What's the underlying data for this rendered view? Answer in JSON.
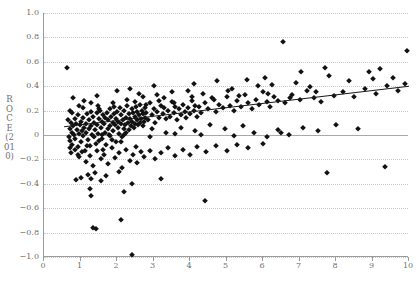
{
  "chart_data": {
    "type": "scatter",
    "title": "",
    "xlabel": "PBR (2010)",
    "ylabel": "ROCE (2010)",
    "xlim": [
      0,
      10
    ],
    "ylim": [
      -1.0,
      1.0
    ],
    "xticks": [
      0,
      1,
      2,
      3,
      4,
      5,
      6,
      7,
      8,
      9,
      10
    ],
    "xticklabels": [
      "0",
      "1",
      "2",
      "3",
      "4",
      "5",
      "6",
      "7",
      "8",
      "9",
      "10"
    ],
    "yticks": [
      -1.0,
      -0.8,
      -0.6,
      -0.4,
      -0.2,
      0,
      0.2,
      0.4,
      0.6,
      0.8,
      1.0
    ],
    "yticklabels": [
      "-1.0",
      "-0.8",
      "-0.6",
      "-0.4",
      "-0.2",
      "0",
      "0.2",
      "0.4",
      "0.6",
      "0.8",
      "1.0"
    ],
    "grid": "horizontal-dotted",
    "legend": "none",
    "marker": "filled-diamond",
    "marker_color": "#111111",
    "grid_color": "#c9c9c9",
    "axis_color": "#9a9a9a",
    "trendline": {
      "type": "linear-fit",
      "color": "#1a1a1a",
      "x_start": 0.55,
      "y_start": 0.068,
      "x_end": 10.0,
      "y_end": 0.4
    },
    "zero_line": {
      "y": 0,
      "color": "#a8a8a8"
    },
    "points": [
      [
        0.62,
        0.55
      ],
      [
        0.68,
        -0.02
      ],
      [
        0.7,
        0.05
      ],
      [
        0.72,
        -0.05
      ],
      [
        0.74,
        0.1
      ],
      [
        0.76,
        0.02
      ],
      [
        0.78,
        -0.08
      ],
      [
        0.8,
        0.07
      ],
      [
        0.82,
        0.0
      ],
      [
        0.84,
        0.13
      ],
      [
        0.86,
        -0.03
      ],
      [
        0.88,
        0.09
      ],
      [
        0.9,
        0.04
      ],
      [
        0.92,
        -0.1
      ],
      [
        0.94,
        0.16
      ],
      [
        0.96,
        0.01
      ],
      [
        0.98,
        0.08
      ],
      [
        1.0,
        -0.06
      ],
      [
        1.02,
        0.11
      ],
      [
        1.04,
        0.03
      ],
      [
        1.06,
        -0.01
      ],
      [
        1.08,
        0.14
      ],
      [
        1.1,
        0.06
      ],
      [
        1.12,
        -0.13
      ],
      [
        1.14,
        0.09
      ],
      [
        1.16,
        0.02
      ],
      [
        1.18,
        0.17
      ],
      [
        1.2,
        -0.04
      ],
      [
        1.22,
        0.12
      ],
      [
        1.24,
        0.05
      ],
      [
        1.26,
        -0.09
      ],
      [
        1.28,
        0.19
      ],
      [
        1.3,
        0.07
      ],
      [
        1.32,
        0.0
      ],
      [
        1.34,
        0.15
      ],
      [
        1.36,
        -0.02
      ],
      [
        1.38,
        0.1
      ],
      [
        1.4,
        0.04
      ],
      [
        1.42,
        -0.07
      ],
      [
        1.44,
        0.18
      ],
      [
        1.46,
        0.08
      ],
      [
        1.48,
        0.01
      ],
      [
        1.5,
        0.13
      ],
      [
        1.52,
        -0.05
      ],
      [
        1.54,
        0.2
      ],
      [
        1.56,
        0.06
      ],
      [
        1.58,
        0.11
      ],
      [
        1.6,
        -0.03
      ],
      [
        1.62,
        0.16
      ],
      [
        1.64,
        0.09
      ],
      [
        1.66,
        0.02
      ],
      [
        1.68,
        0.14
      ],
      [
        1.7,
        -0.08
      ],
      [
        1.72,
        0.18
      ],
      [
        1.74,
        0.05
      ],
      [
        1.76,
        0.12
      ],
      [
        1.78,
        0.0
      ],
      [
        1.8,
        0.21
      ],
      [
        1.82,
        0.07
      ],
      [
        1.84,
        0.15
      ],
      [
        1.86,
        -0.04
      ],
      [
        1.88,
        0.1
      ],
      [
        1.9,
        0.03
      ],
      [
        1.92,
        0.17
      ],
      [
        1.94,
        0.08
      ],
      [
        1.96,
        0.13
      ],
      [
        1.98,
        -0.06
      ],
      [
        2.0,
        0.19
      ],
      [
        2.02,
        0.06
      ],
      [
        2.04,
        0.11
      ],
      [
        2.06,
        0.01
      ],
      [
        2.08,
        0.22
      ],
      [
        2.1,
        0.09
      ],
      [
        2.12,
        0.16
      ],
      [
        2.14,
        -0.02
      ],
      [
        2.16,
        0.12
      ],
      [
        2.18,
        0.05
      ],
      [
        2.2,
        0.2
      ],
      [
        2.22,
        0.08
      ],
      [
        2.24,
        0.14
      ],
      [
        2.26,
        0.02
      ],
      [
        2.28,
        0.24
      ],
      [
        2.3,
        0.1
      ],
      [
        2.32,
        0.17
      ],
      [
        2.34,
        0.04
      ],
      [
        2.36,
        0.13
      ],
      [
        2.38,
        0.07
      ],
      [
        2.4,
        0.21
      ],
      [
        2.42,
        0.11
      ],
      [
        2.44,
        0.18
      ],
      [
        2.46,
        0.06
      ],
      [
        2.48,
        0.15
      ],
      [
        2.5,
        0.09
      ],
      [
        2.52,
        0.23
      ],
      [
        2.54,
        0.12
      ],
      [
        2.56,
        0.19
      ],
      [
        2.58,
        0.08
      ],
      [
        2.6,
        0.16
      ],
      [
        2.62,
        0.1
      ],
      [
        2.64,
        0.25
      ],
      [
        2.66,
        0.13
      ],
      [
        2.68,
        0.2
      ],
      [
        2.7,
        0.07
      ],
      [
        2.72,
        0.17
      ],
      [
        2.74,
        0.11
      ],
      [
        2.76,
        0.22
      ],
      [
        2.78,
        0.14
      ],
      [
        2.8,
        0.18
      ],
      [
        2.85,
        0.12
      ],
      [
        2.9,
        0.26
      ],
      [
        2.95,
        0.16
      ],
      [
        3.0,
        0.21
      ],
      [
        3.05,
        0.1
      ],
      [
        3.1,
        0.19
      ],
      [
        3.15,
        0.14
      ],
      [
        3.2,
        0.24
      ],
      [
        3.25,
        0.17
      ],
      [
        3.3,
        0.22
      ],
      [
        3.35,
        0.13
      ],
      [
        3.4,
        0.2
      ],
      [
        3.45,
        0.15
      ],
      [
        3.5,
        0.27
      ],
      [
        3.55,
        0.18
      ],
      [
        3.6,
        0.23
      ],
      [
        3.65,
        0.12
      ],
      [
        3.7,
        0.21
      ],
      [
        3.75,
        0.16
      ],
      [
        3.8,
        0.25
      ],
      [
        3.85,
        0.19
      ],
      [
        3.9,
        0.14
      ],
      [
        3.95,
        0.22
      ],
      [
        4.0,
        0.17
      ],
      [
        4.05,
        0.28
      ],
      [
        4.1,
        0.2
      ],
      [
        4.15,
        0.24
      ],
      [
        4.2,
        0.15
      ],
      [
        4.25,
        0.23
      ],
      [
        4.3,
        0.18
      ],
      [
        4.4,
        0.26
      ],
      [
        4.5,
        0.21
      ],
      [
        4.6,
        0.3
      ],
      [
        4.7,
        0.19
      ],
      [
        4.8,
        0.25
      ],
      [
        4.9,
        0.22
      ],
      [
        5.0,
        0.31
      ],
      [
        5.1,
        0.24
      ],
      [
        5.2,
        0.2
      ],
      [
        5.3,
        0.28
      ],
      [
        5.4,
        0.23
      ],
      [
        5.5,
        0.33
      ],
      [
        5.6,
        0.26
      ],
      [
        5.7,
        0.21
      ],
      [
        5.8,
        0.29
      ],
      [
        5.9,
        0.25
      ],
      [
        6.0,
        0.35
      ],
      [
        6.1,
        0.27
      ],
      [
        6.2,
        0.23
      ],
      [
        6.3,
        0.31
      ],
      [
        6.4,
        0.28
      ],
      [
        6.55,
        0.76
      ],
      [
        6.6,
        0.26
      ],
      [
        6.8,
        0.33
      ],
      [
        7.0,
        0.29
      ],
      [
        7.2,
        0.36
      ],
      [
        7.4,
        0.3
      ],
      [
        7.6,
        0.27
      ],
      [
        7.8,
        0.48
      ],
      [
        7.95,
        0.32
      ],
      [
        8.2,
        0.35
      ],
      [
        8.5,
        0.31
      ],
      [
        8.8,
        0.38
      ],
      [
        9.1,
        0.34
      ],
      [
        9.4,
        0.4
      ],
      [
        9.7,
        0.36
      ],
      [
        9.95,
        0.69
      ],
      [
        9.9,
        0.42
      ],
      [
        0.75,
        -0.15
      ],
      [
        0.85,
        -0.12
      ],
      [
        0.95,
        -0.18
      ],
      [
        1.05,
        -0.14
      ],
      [
        1.15,
        -0.22
      ],
      [
        1.25,
        -0.17
      ],
      [
        1.35,
        -0.25
      ],
      [
        1.45,
        -0.13
      ],
      [
        1.55,
        -0.2
      ],
      [
        1.65,
        -0.16
      ],
      [
        1.75,
        -0.24
      ],
      [
        1.85,
        -0.11
      ],
      [
        1.95,
        -0.19
      ],
      [
        2.05,
        -0.15
      ],
      [
        2.15,
        -0.27
      ],
      [
        2.25,
        -0.12
      ],
      [
        2.35,
        -0.21
      ],
      [
        2.45,
        -0.16
      ],
      [
        2.55,
        -0.23
      ],
      [
        2.65,
        -0.14
      ],
      [
        2.75,
        -0.18
      ],
      [
        2.9,
        -0.13
      ],
      [
        3.05,
        -0.2
      ],
      [
        3.2,
        -0.15
      ],
      [
        3.4,
        -0.11
      ],
      [
        3.6,
        -0.17
      ],
      [
        3.8,
        -0.12
      ],
      [
        4.0,
        -0.16
      ],
      [
        4.2,
        -0.1
      ],
      [
        4.45,
        -0.14
      ],
      [
        4.7,
        -0.09
      ],
      [
        5.0,
        -0.13
      ],
      [
        5.3,
        -0.08
      ],
      [
        5.6,
        -0.11
      ],
      [
        6.0,
        -0.07
      ],
      [
        1.2,
        -0.33
      ],
      [
        1.3,
        -0.36
      ],
      [
        1.4,
        -0.31
      ],
      [
        1.55,
        -0.38
      ],
      [
        1.7,
        -0.34
      ],
      [
        2.4,
        -0.4
      ],
      [
        3.2,
        -0.36
      ],
      [
        2.05,
        -0.3
      ],
      [
        1.25,
        -0.44
      ],
      [
        1.3,
        -0.5
      ],
      [
        2.2,
        -0.47
      ],
      [
        4.4,
        -0.54
      ],
      [
        1.35,
        -0.76
      ],
      [
        1.42,
        -0.77
      ],
      [
        2.1,
        -0.7
      ],
      [
        2.42,
        -0.98
      ],
      [
        0.88,
        -0.37
      ],
      [
        1.02,
        -0.35
      ],
      [
        9.35,
        -0.26
      ],
      [
        7.75,
        -0.31
      ],
      [
        6.1,
        -0.02
      ],
      [
        6.4,
        0.04
      ],
      [
        6.7,
        0.0
      ],
      [
        7.1,
        0.06
      ],
      [
        7.5,
        0.03
      ],
      [
        8.0,
        0.08
      ],
      [
        8.6,
        0.05
      ],
      [
        5.45,
        0.07
      ],
      [
        5.75,
        0.02
      ],
      [
        4.95,
        0.05
      ],
      [
        4.55,
        0.08
      ],
      [
        4.15,
        0.03
      ],
      [
        3.75,
        0.06
      ],
      [
        3.35,
        0.02
      ],
      [
        2.95,
        0.05
      ],
      [
        0.66,
        0.12
      ],
      [
        0.7,
        -0.11
      ],
      [
        0.78,
        0.18
      ],
      [
        0.92,
        -0.16
      ],
      [
        1.08,
        0.22
      ],
      [
        1.18,
        -0.09
      ],
      [
        1.48,
        0.24
      ],
      [
        1.62,
        -0.12
      ],
      [
        1.88,
        0.26
      ],
      [
        2.12,
        -0.06
      ],
      [
        2.28,
        0.29
      ],
      [
        2.52,
        -0.1
      ],
      [
        2.72,
        0.31
      ],
      [
        3.1,
        0.33
      ],
      [
        3.5,
        0.35
      ],
      [
        3.95,
        0.36
      ],
      [
        4.35,
        0.34
      ],
      [
        5.15,
        0.38
      ],
      [
        5.85,
        0.4
      ],
      [
        6.25,
        0.41
      ],
      [
        6.9,
        0.43
      ],
      [
        7.3,
        0.39
      ],
      [
        8.35,
        0.44
      ],
      [
        9.0,
        0.46
      ],
      [
        9.55,
        0.47
      ],
      [
        0.8,
        0.3
      ],
      [
        1.1,
        0.28
      ],
      [
        1.45,
        0.32
      ],
      [
        2.0,
        0.36
      ],
      [
        2.35,
        0.38
      ],
      [
        2.6,
        0.34
      ],
      [
        3.0,
        0.4
      ],
      [
        3.3,
        0.3
      ],
      [
        4.1,
        0.42
      ],
      [
        4.75,
        0.44
      ],
      [
        5.05,
        0.36
      ],
      [
        5.55,
        0.45
      ],
      [
        6.05,
        0.47
      ],
      [
        7.05,
        0.52
      ],
      [
        7.7,
        0.55
      ],
      [
        8.9,
        0.52
      ],
      [
        9.2,
        0.54
      ],
      [
        1.6,
        0.0
      ],
      [
        1.8,
        -0.01
      ],
      [
        2.18,
        0.0
      ],
      [
        2.9,
        -0.02
      ],
      [
        3.6,
        0.01
      ],
      [
        4.3,
        0.0
      ],
      [
        5.2,
        -0.01
      ],
      [
        6.5,
        0.02
      ],
      [
        0.72,
        0.2
      ],
      [
        0.95,
        0.24
      ],
      [
        1.28,
        0.26
      ],
      [
        1.52,
        0.21
      ],
      [
        1.92,
        0.23
      ],
      [
        2.48,
        0.27
      ],
      [
        2.8,
        0.25
      ],
      [
        3.15,
        0.28
      ],
      [
        3.55,
        0.26
      ],
      [
        4.05,
        0.31
      ],
      [
        4.65,
        0.29
      ],
      [
        5.35,
        0.32
      ],
      [
        6.15,
        0.34
      ],
      [
        6.75,
        0.3
      ],
      [
        7.45,
        0.35
      ]
    ]
  }
}
